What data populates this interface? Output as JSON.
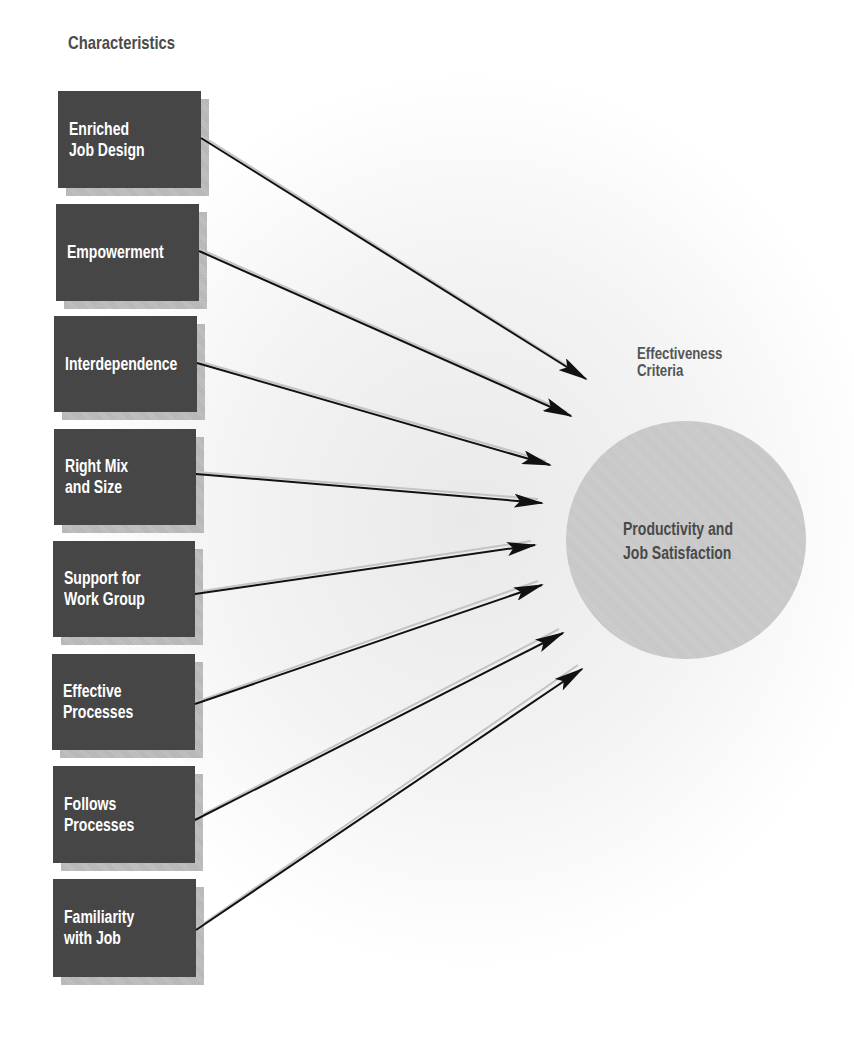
{
  "heading": "Characteristics",
  "criteria": {
    "label_lines": [
      "Effectiveness",
      "Criteria"
    ],
    "outcome_lines": [
      "Productivity and",
      "Job Satisfaction"
    ]
  },
  "characteristics": [
    {
      "lines": [
        "Enriched",
        "Job Design"
      ],
      "box": [
        58,
        91,
        143,
        97
      ],
      "from": [
        201,
        138
      ],
      "to": [
        586,
        379
      ]
    },
    {
      "lines": [
        "Empowerment"
      ],
      "box": [
        56,
        204,
        143,
        97
      ],
      "from": [
        199,
        251
      ],
      "to": [
        571,
        416
      ]
    },
    {
      "lines": [
        "Interdependence"
      ],
      "box": [
        54,
        316,
        143,
        96
      ],
      "from": [
        197,
        363
      ],
      "to": [
        550,
        465
      ]
    },
    {
      "lines": [
        "Right Mix",
        "and Size"
      ],
      "box": [
        54,
        429,
        142,
        96
      ],
      "from": [
        196,
        474
      ],
      "to": [
        542,
        503
      ]
    },
    {
      "lines": [
        "Support for",
        "Work Group"
      ],
      "box": [
        53,
        541,
        142,
        96
      ],
      "from": [
        195,
        594
      ],
      "to": [
        535,
        545
      ]
    },
    {
      "lines": [
        "Effective",
        "Processes"
      ],
      "box": [
        52,
        654,
        143,
        96
      ],
      "from": [
        195,
        704
      ],
      "to": [
        542,
        585
      ]
    },
    {
      "lines": [
        "Follows",
        "Processes"
      ],
      "box": [
        53,
        766,
        142,
        97
      ],
      "from": [
        195,
        820
      ],
      "to": [
        563,
        633
      ]
    },
    {
      "lines": [
        "Familiarity",
        "with Job"
      ],
      "box": [
        53,
        879,
        143,
        98
      ],
      "from": [
        196,
        930
      ],
      "to": [
        582,
        669
      ]
    }
  ],
  "colors": {
    "box_fill": "#464646",
    "box_text": "#ffffff",
    "box_shadow": "#b9b9b9",
    "circle_fill": "#c9c9c9",
    "label_text": "#555555",
    "arrow": "#111111"
  }
}
